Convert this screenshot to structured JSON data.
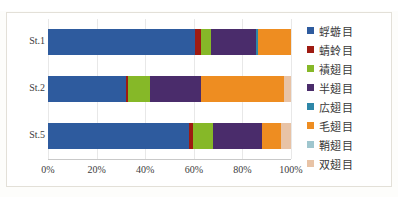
{
  "top_strip_text": "",
  "chart_data": {
    "type": "bar",
    "subtype": "stacked-horizontal-100-percent",
    "title": "",
    "xlabel": "",
    "ylabel": "",
    "xlim": [
      0,
      100
    ],
    "grid": true,
    "legend_position": "right",
    "x_tick_labels": [
      "0%",
      "20%",
      "40%",
      "60%",
      "80%",
      "100%"
    ],
    "x_tick_values": [
      0,
      20,
      40,
      60,
      80,
      100
    ],
    "categories": [
      "St.1",
      "St.2",
      "St.5"
    ],
    "series": [
      {
        "name": "蜉蝣目",
        "color": "#2E5B9E",
        "values": [
          60.5,
          32.0,
          58.0
        ]
      },
      {
        "name": "蜻蛉目",
        "color": "#9E1B12",
        "values": [
          2.5,
          1.0,
          1.5
        ]
      },
      {
        "name": "襀翅目",
        "color": "#86B828",
        "values": [
          4.0,
          9.0,
          8.5
        ]
      },
      {
        "name": "半翅目",
        "color": "#4A2C6B",
        "values": [
          18.5,
          21.0,
          20.0
        ]
      },
      {
        "name": "広翅目",
        "color": "#2E87A8",
        "values": [
          1.0,
          0.0,
          0.0
        ]
      },
      {
        "name": "毛翅目",
        "color": "#EE8D21",
        "values": [
          13.5,
          34.0,
          8.0
        ]
      },
      {
        "name": "鞘翅目",
        "color": "#9FC6CE",
        "values": [
          0.0,
          0.0,
          0.0
        ]
      },
      {
        "name": "双翅目",
        "color": "#E8C3A6",
        "values": [
          0.0,
          3.0,
          4.0
        ]
      }
    ]
  }
}
